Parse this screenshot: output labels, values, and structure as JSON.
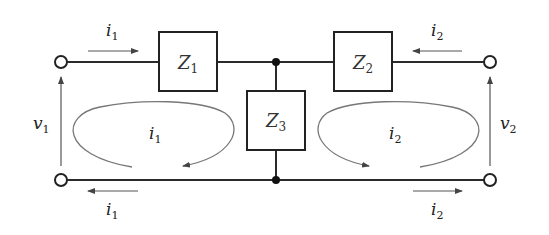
{
  "diagram": {
    "type": "two-port T-network circuit",
    "impedances": [
      {
        "name": "Z",
        "sub": "1"
      },
      {
        "name": "Z",
        "sub": "2"
      },
      {
        "name": "Z",
        "sub": "3"
      }
    ],
    "voltages": [
      {
        "name": "v",
        "sub": "1"
      },
      {
        "name": "v",
        "sub": "2"
      }
    ],
    "currents": {
      "top_left": {
        "name": "i",
        "sub": "1"
      },
      "top_right": {
        "name": "i",
        "sub": "2"
      },
      "bottom_left": {
        "name": "i",
        "sub": "1"
      },
      "bottom_right": {
        "name": "i",
        "sub": "2"
      },
      "loop_left": {
        "name": "i",
        "sub": "1"
      },
      "loop_right": {
        "name": "i",
        "sub": "2"
      }
    },
    "colors": {
      "wire": "#2a2a2a",
      "arrow": "#555555",
      "loop": "#777777"
    }
  }
}
